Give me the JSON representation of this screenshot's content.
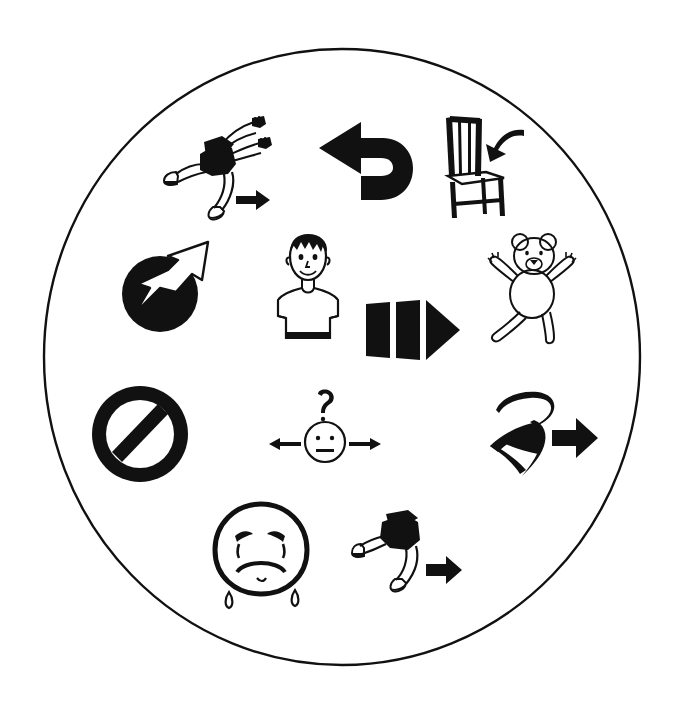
{
  "canvas": {
    "width": 675,
    "height": 704,
    "background_color": "#ffffff",
    "ink_color": "#111111"
  },
  "board": {
    "shape": "circle",
    "center_x": 342,
    "center_y": 357,
    "radius_x": 298,
    "radius_y": 308,
    "stroke_width": 2.4,
    "fill_color": "#ffffff",
    "stroke_color": "#111111",
    "title": "Pictogram communication circle"
  },
  "pictograms": [
    {
      "id": "run-with-arms",
      "name": "running-person-with-arms-icon",
      "label": "Running figure with outstretched arms and forward arrow",
      "meaning": "run / move quickly forward",
      "row": 1,
      "column": 1,
      "x": 160,
      "y": 112,
      "width": 118,
      "height": 110
    },
    {
      "id": "u-turn-arrow",
      "name": "u-turn-arrow-icon",
      "label": "Thick U-turn arrow pointing left",
      "meaning": "turn back / go around",
      "row": 1,
      "column": 2,
      "x": 317,
      "y": 114,
      "width": 118,
      "height": 104
    },
    {
      "id": "sit-on-chair",
      "name": "chair-sit-down-icon",
      "label": "Chair with curved arrow pointing to the seat",
      "meaning": "sit down",
      "row": 1,
      "column": 3,
      "x": 432,
      "y": 114,
      "width": 98,
      "height": 108
    },
    {
      "id": "ball-throw",
      "name": "ball-with-arrow-icon",
      "label": "Black ball with white arrow shooting up to the right",
      "meaning": "throw / launch the ball",
      "row": 2,
      "column": 1,
      "x": 116,
      "y": 236,
      "width": 112,
      "height": 100
    },
    {
      "id": "boy-figure",
      "name": "boy-standing-icon",
      "label": "Smiling boy with spiky hair standing facing forward",
      "meaning": "me / person",
      "row": 2,
      "column": 2,
      "x": 262,
      "y": 232,
      "width": 92,
      "height": 116
    },
    {
      "id": "block-arrow",
      "name": "segmented-right-arrow-icon",
      "label": "Thick segmented arrow pointing right",
      "meaning": "go forward / next",
      "row": 2,
      "column": 3,
      "x": 364,
      "y": 294,
      "width": 100,
      "height": 72
    },
    {
      "id": "teddy-bear",
      "name": "teddy-bear-icon",
      "label": "Teddy bear with arms and legs spread out",
      "meaning": "teddy bear / toy",
      "row": 2,
      "column": 4,
      "x": 480,
      "y": 228,
      "width": 108,
      "height": 118
    },
    {
      "id": "prohibition-sign",
      "name": "no-entry-prohibition-icon",
      "label": "Black circle with diagonal slash",
      "meaning": "no / not allowed / stop",
      "row": 3,
      "column": 1,
      "x": 88,
      "y": 382,
      "width": 104,
      "height": 104
    },
    {
      "id": "confused-face",
      "name": "questioning-face-with-arrows-icon",
      "label": "Neutral face with a question mark above and arrows pointing left and right",
      "meaning": "which way? / I don't know",
      "row": 3,
      "column": 2,
      "x": 261,
      "y": 390,
      "width": 128,
      "height": 80
    },
    {
      "id": "swirl-arrow",
      "name": "swirl-loop-with-arrow-icon",
      "label": "Brush-stroke loop swirl beside a right-pointing arrow",
      "meaning": "swing around / whirl then go",
      "row": 3,
      "column": 3,
      "x": 488,
      "y": 390,
      "width": 110,
      "height": 94
    },
    {
      "id": "crying-face",
      "name": "crying-sad-face-icon",
      "label": "Sad face with tears running down",
      "meaning": "sad / crying",
      "row": 4,
      "column": 1,
      "x": 205,
      "y": 500,
      "width": 112,
      "height": 112
    },
    {
      "id": "run-legs",
      "name": "running-legs-icon",
      "label": "Running legs with a forward arrow",
      "meaning": "run / go",
      "row": 4,
      "column": 2,
      "x": 352,
      "y": 508,
      "width": 112,
      "height": 88
    }
  ]
}
